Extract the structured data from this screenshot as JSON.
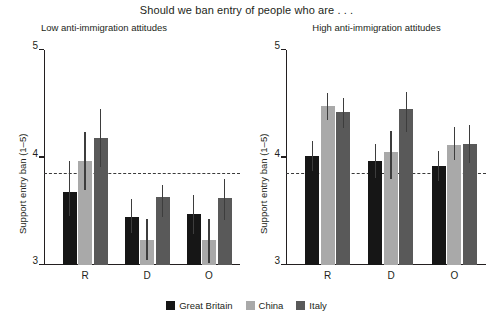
{
  "chart_data": {
    "type": "bar",
    "title": "Should we ban entry of people who are . . .",
    "ylabel": "Support entry ban (1–5)",
    "xlabel": "",
    "ylim": [
      3,
      5
    ],
    "yticks": [
      3,
      4,
      5
    ],
    "ytick_labels": [
      "3",
      "4",
      "5"
    ],
    "grid": false,
    "legend_position": "bottom",
    "reference_line": 3.85,
    "categories": [
      "R",
      "D",
      "O"
    ],
    "legend": [
      "Great Britain",
      "China",
      "Italy"
    ],
    "colors": {
      "great_britain": "#161616",
      "china": "#a9a9a9",
      "italy": "#595959",
      "axis": "#231f20",
      "reference_line": "#3a3a3a",
      "error_bar": "#3d3d3d"
    },
    "panels": [
      {
        "title": "Low anti-immigration attitudes",
        "ylabel": "Support entry ban (1–5)",
        "categories": [
          "R",
          "D",
          "O"
        ],
        "series": [
          {
            "name": "Great Britain",
            "values": [
              3.68,
              3.45,
              3.47
            ],
            "ci_low": [
              3.46,
              3.3,
              3.29
            ],
            "ci_high": [
              3.97,
              3.61,
              3.65
            ]
          },
          {
            "name": "China",
            "values": [
              3.97,
              3.23,
              3.23
            ],
            "ci_low": [
              3.7,
              3.05,
              3.02
            ],
            "ci_high": [
              4.24,
              3.43,
              3.43
            ]
          },
          {
            "name": "Italy",
            "values": [
              4.18,
              3.63,
              3.62
            ],
            "ci_low": [
              3.91,
              3.45,
              3.42
            ],
            "ci_high": [
              4.45,
              3.74,
              3.8
            ]
          }
        ]
      },
      {
        "title": "High anti-immigration attitudes",
        "ylabel": "Support entry ban (1–5)",
        "categories": [
          "R",
          "D",
          "O"
        ],
        "series": [
          {
            "name": "Great Britain",
            "values": [
              4.01,
              3.97,
              3.92
            ],
            "ci_low": [
              3.87,
              3.81,
              3.78
            ],
            "ci_high": [
              4.15,
              4.13,
              4.06
            ]
          },
          {
            "name": "China",
            "values": [
              4.48,
              4.05,
              4.12
            ],
            "ci_low": [
              4.35,
              3.8,
              3.98
            ],
            "ci_high": [
              4.6,
              4.25,
              4.28
            ]
          },
          {
            "name": "Italy",
            "values": [
              4.42,
              4.45,
              4.13
            ],
            "ci_low": [
              4.27,
              4.24,
              3.95
            ],
            "ci_high": [
              4.55,
              4.61,
              4.3
            ]
          }
        ]
      }
    ]
  }
}
